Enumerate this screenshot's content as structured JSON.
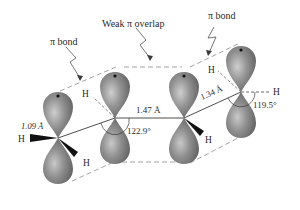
{
  "labels": {
    "pi_bond_left": "π bond",
    "weak_overlap": "Weak π overlap",
    "pi_bond_right": "π bond",
    "ch_length": "1.09 Å",
    "single_bond_length": "1.47 Å",
    "double_bond_length": "1.34 Å",
    "angle_left": "122.9°",
    "angle_right": "119.5°",
    "h": "H"
  },
  "colors": {
    "lobe_fill": "#8a8a8a",
    "lobe_highlight": "#c4c4c4",
    "lobe_dark": "#5e5e5e",
    "dashed_line": "#8c8c8c",
    "bond_line": "#3a3a3a",
    "text": "#2a2a2a"
  }
}
